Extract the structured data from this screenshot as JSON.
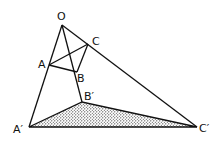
{
  "diagram": {
    "type": "geometry-perspective-triangles",
    "colors": {
      "line": "#111111",
      "fill_dots": "#222222",
      "background": "#ffffff"
    },
    "points": {
      "O": {
        "label": "O",
        "x": 62,
        "y": 25
      },
      "A": {
        "label": "A",
        "x": 49,
        "y": 65
      },
      "B": {
        "label": "B",
        "x": 77,
        "y": 72
      },
      "C": {
        "label": "C",
        "x": 88,
        "y": 44
      },
      "A'": {
        "label": "A′",
        "x": 29,
        "y": 127
      },
      "B'": {
        "label": "B′",
        "x": 82,
        "y": 102
      },
      "C'": {
        "label": "C′",
        "x": 197,
        "y": 127
      }
    },
    "labels": {
      "O": "O",
      "A": "A",
      "B": "B",
      "C": "C",
      "Ap": "A′",
      "Bp": "B′",
      "Cp": "C′"
    },
    "segments": [
      [
        "O",
        "A'"
      ],
      [
        "O",
        "B'"
      ],
      [
        "O",
        "C'"
      ],
      [
        "A",
        "B"
      ],
      [
        "B",
        "C"
      ],
      [
        "C",
        "A"
      ],
      [
        "A'",
        "B'"
      ],
      [
        "B'",
        "C'"
      ],
      [
        "C'",
        "A'"
      ]
    ],
    "shaded_polygon": [
      "A'",
      "B'",
      "C'"
    ]
  }
}
